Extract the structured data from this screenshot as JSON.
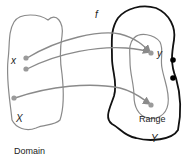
{
  "diagram": {
    "function_label": "f",
    "domain_set_label": "X",
    "codomain_set_label": "Y",
    "element_x_label": "x",
    "element_y_label": "y",
    "range_label": "Range",
    "domain_caption": "Domain",
    "colors": {
      "gray_line": "#8a8a8a",
      "black_line": "#111111",
      "dot_gray": "#9a9a9a",
      "dot_black": "#000000"
    }
  }
}
